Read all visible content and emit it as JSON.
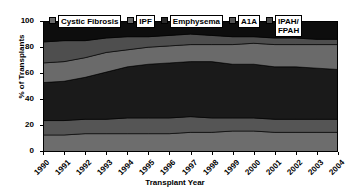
{
  "chart_data": {
    "type": "area",
    "title": "",
    "subtitle": "",
    "xlabel": "Transplant Year",
    "ylabel": "% of Transplants",
    "categories": [
      "1990",
      "1991",
      "1992",
      "1993",
      "1994",
      "1995",
      "1996",
      "1997",
      "1998",
      "1999",
      "2000",
      "2001",
      "2002",
      "2003",
      "2004"
    ],
    "x": [
      1990,
      1991,
      1992,
      1993,
      1994,
      1995,
      1996,
      1997,
      1998,
      1999,
      2000,
      2001,
      2002,
      2003,
      2004
    ],
    "xlim": [
      1990,
      2004
    ],
    "ylim": [
      0,
      100
    ],
    "yticks": [
      0,
      20,
      40,
      60,
      80,
      100
    ],
    "grid": false,
    "stacked": true,
    "legend_position": "top-inside",
    "series": [
      {
        "name": "Cystic Fibrosis",
        "color": "#6d6d6d",
        "values": [
          13,
          13,
          14,
          14,
          14,
          14,
          14,
          15,
          15,
          16,
          16,
          15,
          15,
          15,
          15
        ]
      },
      {
        "name": "A1A",
        "color": "#555555",
        "values": [
          11,
          11,
          11,
          11,
          12,
          12,
          12,
          12,
          11,
          10,
          10,
          10,
          10,
          10,
          10
        ]
      },
      {
        "name": "Emphysema",
        "color": "#1a1a1a",
        "values": [
          29,
          30,
          32,
          36,
          39,
          41,
          42,
          42,
          43,
          41,
          41,
          40,
          40,
          39,
          38
        ]
      },
      {
        "name": "IPF",
        "color": "#6a6a6a",
        "values": [
          15,
          15,
          15,
          15,
          13,
          13,
          13,
          13,
          13,
          15,
          16,
          17,
          17,
          18,
          19
        ]
      },
      {
        "name": "IPAH/FPAH",
        "color": "#4e4e4e",
        "values": [
          16,
          16,
          13,
          11,
          10,
          8,
          8,
          8,
          7,
          6,
          5,
          5,
          5,
          4,
          4
        ]
      },
      {
        "name": "Other",
        "color": "#0d0d0d",
        "values": [
          16,
          15,
          15,
          13,
          12,
          12,
          11,
          10,
          11,
          12,
          12,
          13,
          13,
          14,
          14
        ]
      }
    ]
  },
  "axes": {
    "y": {
      "title": "% of Transplants",
      "ticks": [
        "0",
        "20",
        "40",
        "60",
        "80",
        "100"
      ]
    },
    "x": {
      "title": "Transplant Year",
      "ticks": [
        "1990",
        "1991",
        "1992",
        "1993",
        "1994",
        "1995",
        "1996",
        "1997",
        "1998",
        "1999",
        "2000",
        "2001",
        "2002",
        "2003",
        "2004"
      ]
    }
  },
  "legend": {
    "items": [
      {
        "label": "Cystic Fibrosis",
        "color": "#6d6d6d"
      },
      {
        "label": "IPF",
        "color": "#6a6a6a"
      },
      {
        "label": "Emphysema",
        "color": "#1a1a1a"
      },
      {
        "label": "A1A",
        "color": "#555555"
      },
      {
        "label": "IPAH/\nFPAH",
        "color": "#4e4e4e"
      }
    ]
  },
  "colors": {
    "background": "#ffffff",
    "axis": "#000000",
    "plot_background": "#111111"
  }
}
